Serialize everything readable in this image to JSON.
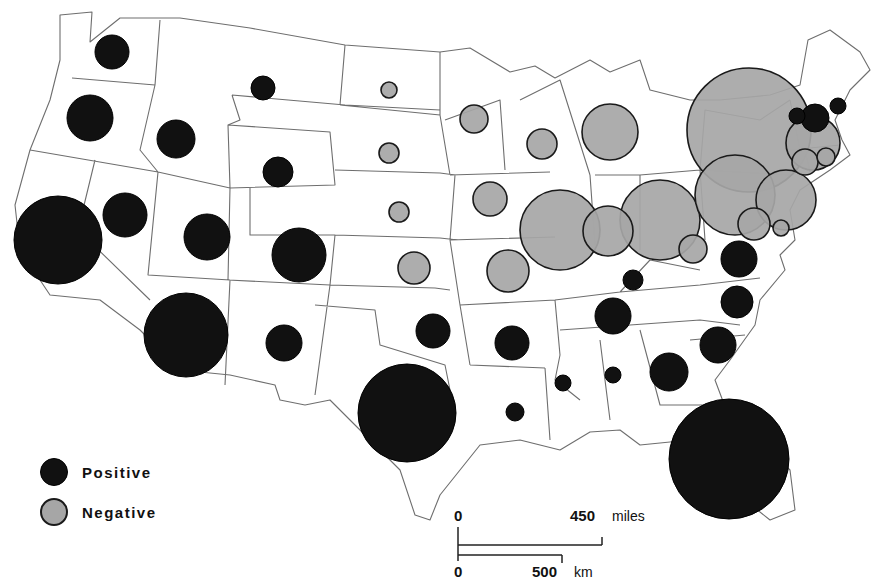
{
  "map": {
    "type": "proportional-symbol",
    "region": "Contiguous United States",
    "colors": {
      "positive": "#111111",
      "negative": "#a6a6a6",
      "border": "#6e6e6e"
    }
  },
  "legend": {
    "items": [
      {
        "label": "Positive",
        "color": "#111111"
      },
      {
        "label": "Negative",
        "color": "#a6a6a6"
      }
    ]
  },
  "scale_bar": {
    "miles": {
      "start": "0",
      "end": "450",
      "unit": "miles"
    },
    "km": {
      "start": "0",
      "end": "500",
      "unit": "km"
    }
  },
  "chart_data": {
    "type": "proportional-symbol-map",
    "title": "",
    "legend": [
      "Positive",
      "Negative"
    ],
    "symbols": [
      {
        "state": "WA",
        "sign": "positive",
        "x": 112,
        "y": 52,
        "r": 17
      },
      {
        "state": "OR",
        "sign": "positive",
        "x": 90,
        "y": 118,
        "r": 23
      },
      {
        "state": "CA",
        "sign": "positive",
        "x": 58,
        "y": 240,
        "r": 44
      },
      {
        "state": "ID",
        "sign": "positive",
        "x": 176,
        "y": 139,
        "r": 19
      },
      {
        "state": "NV",
        "sign": "positive",
        "x": 125,
        "y": 215,
        "r": 22
      },
      {
        "state": "MT",
        "sign": "positive",
        "x": 263,
        "y": 88,
        "r": 12
      },
      {
        "state": "WY",
        "sign": "positive",
        "x": 278,
        "y": 172,
        "r": 15
      },
      {
        "state": "UT",
        "sign": "positive",
        "x": 207,
        "y": 237,
        "r": 23
      },
      {
        "state": "CO",
        "sign": "positive",
        "x": 299,
        "y": 255,
        "r": 27
      },
      {
        "state": "AZ",
        "sign": "positive",
        "x": 186,
        "y": 335,
        "r": 42
      },
      {
        "state": "NM",
        "sign": "positive",
        "x": 284,
        "y": 343,
        "r": 18
      },
      {
        "state": "ND",
        "sign": "negative",
        "x": 389,
        "y": 90,
        "r": 8
      },
      {
        "state": "SD",
        "sign": "negative",
        "x": 389,
        "y": 153,
        "r": 10
      },
      {
        "state": "NE",
        "sign": "negative",
        "x": 399,
        "y": 212,
        "r": 10
      },
      {
        "state": "KS",
        "sign": "negative",
        "x": 414,
        "y": 268,
        "r": 16
      },
      {
        "state": "OK",
        "sign": "positive",
        "x": 433,
        "y": 331,
        "r": 17
      },
      {
        "state": "TX",
        "sign": "positive",
        "x": 407,
        "y": 413,
        "r": 49
      },
      {
        "state": "MN",
        "sign": "negative",
        "x": 474,
        "y": 119,
        "r": 14
      },
      {
        "state": "WI",
        "sign": "negative",
        "x": 542,
        "y": 144,
        "r": 15
      },
      {
        "state": "IA",
        "sign": "negative",
        "x": 490,
        "y": 199,
        "r": 17
      },
      {
        "state": "MO",
        "sign": "negative",
        "x": 508,
        "y": 271,
        "r": 21
      },
      {
        "state": "IL",
        "sign": "negative",
        "x": 560,
        "y": 230,
        "r": 40
      },
      {
        "state": "IN",
        "sign": "negative",
        "x": 608,
        "y": 231,
        "r": 25
      },
      {
        "state": "MI",
        "sign": "negative",
        "x": 610,
        "y": 132,
        "r": 28
      },
      {
        "state": "OH",
        "sign": "negative",
        "x": 660,
        "y": 220,
        "r": 40
      },
      {
        "state": "KY",
        "sign": "positive",
        "x": 633,
        "y": 280,
        "r": 10
      },
      {
        "state": "AR",
        "sign": "positive",
        "x": 512,
        "y": 343,
        "r": 17
      },
      {
        "state": "LA",
        "sign": "positive",
        "x": 515,
        "y": 412,
        "r": 9
      },
      {
        "state": "MS",
        "sign": "positive",
        "x": 563,
        "y": 383,
        "r": 8
      },
      {
        "state": "AL",
        "sign": "positive",
        "x": 613,
        "y": 375,
        "r": 8
      },
      {
        "state": "TN",
        "sign": "positive",
        "x": 613,
        "y": 316,
        "r": 18
      },
      {
        "state": "GA",
        "sign": "positive",
        "x": 669,
        "y": 372,
        "r": 19
      },
      {
        "state": "SC",
        "sign": "positive",
        "x": 718,
        "y": 345,
        "r": 18
      },
      {
        "state": "NC",
        "sign": "positive",
        "x": 737,
        "y": 302,
        "r": 16
      },
      {
        "state": "VA",
        "sign": "positive",
        "x": 739,
        "y": 259,
        "r": 18
      },
      {
        "state": "FL",
        "sign": "positive",
        "x": 729,
        "y": 459,
        "r": 60
      },
      {
        "state": "WV",
        "sign": "negative",
        "x": 693,
        "y": 249,
        "r": 14
      },
      {
        "state": "PA",
        "sign": "negative",
        "x": 735,
        "y": 195,
        "r": 40
      },
      {
        "state": "NY",
        "sign": "negative",
        "x": 749,
        "y": 130,
        "r": 62
      },
      {
        "state": "NJ",
        "sign": "negative",
        "x": 786,
        "y": 200,
        "r": 30
      },
      {
        "state": "MD",
        "sign": "negative",
        "x": 754,
        "y": 224,
        "r": 16
      },
      {
        "state": "DE",
        "sign": "negative",
        "x": 781,
        "y": 228,
        "r": 8
      },
      {
        "state": "CT",
        "sign": "negative",
        "x": 805,
        "y": 162,
        "r": 13
      },
      {
        "state": "RI",
        "sign": "negative",
        "x": 826,
        "y": 157,
        "r": 9
      },
      {
        "state": "MA",
        "sign": "negative",
        "x": 813,
        "y": 143,
        "r": 27
      },
      {
        "state": "VT",
        "sign": "positive",
        "x": 797,
        "y": 116,
        "r": 8
      },
      {
        "state": "NH",
        "sign": "positive",
        "x": 815,
        "y": 118,
        "r": 14
      },
      {
        "state": "ME",
        "sign": "positive",
        "x": 838,
        "y": 106,
        "r": 8
      }
    ],
    "scale": {
      "miles": [
        0,
        450
      ],
      "km": [
        0,
        500
      ]
    }
  }
}
